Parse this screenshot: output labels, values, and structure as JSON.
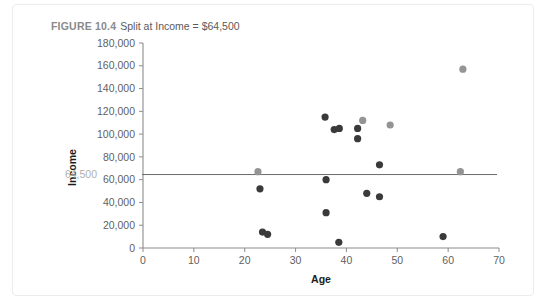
{
  "figure": {
    "number_label": "FIGURE 10.4",
    "caption": "Split at Income = $64,500"
  },
  "chart_data": {
    "type": "scatter",
    "title": "Split at Income = $64,500",
    "xlabel": "Age",
    "ylabel": "Income",
    "xlim": [
      0,
      70
    ],
    "ylim": [
      0,
      180000
    ],
    "xticks": [
      0,
      10,
      20,
      30,
      40,
      50,
      60,
      70
    ],
    "xtick_labels": [
      "0",
      "10",
      "20",
      "30",
      "40",
      "50",
      "60",
      "70"
    ],
    "yticks": [
      0,
      20000,
      40000,
      60000,
      80000,
      100000,
      120000,
      140000,
      160000,
      180000
    ],
    "ytick_labels": [
      "0",
      "20,000",
      "40,000",
      "60,000",
      "80,000",
      "100,000",
      "120,000",
      "140,000",
      "160,000",
      "180,000"
    ],
    "grid": false,
    "legend": null,
    "threshold": {
      "value": 64500,
      "label": "64,500",
      "orientation": "horizontal",
      "color": "#6b6b6b"
    },
    "colors": {
      "dark_point": "#3a3a3a",
      "light_point": "#949494",
      "axis": "#8c8c8c",
      "threshold": "#6b6b6b",
      "threshold_label": "#b0b0b0",
      "title": "#6f6f6f",
      "background": "#ffffff"
    },
    "series": [
      {
        "name": "dark-points",
        "color": "#3a3a3a",
        "points": [
          {
            "x": 23.5,
            "y": 14000
          },
          {
            "x": 24.5,
            "y": 12000
          },
          {
            "x": 23.0,
            "y": 52000
          },
          {
            "x": 35.8,
            "y": 115000
          },
          {
            "x": 37.6,
            "y": 104000
          },
          {
            "x": 38.6,
            "y": 105000
          },
          {
            "x": 36.0,
            "y": 60000
          },
          {
            "x": 36.0,
            "y": 31000
          },
          {
            "x": 38.5,
            "y": 5000
          },
          {
            "x": 42.2,
            "y": 105000
          },
          {
            "x": 42.2,
            "y": 96000
          },
          {
            "x": 44.0,
            "y": 48000
          },
          {
            "x": 46.5,
            "y": 45000
          },
          {
            "x": 46.5,
            "y": 73000
          },
          {
            "x": 59.0,
            "y": 10000
          }
        ]
      },
      {
        "name": "light-points",
        "color": "#949494",
        "points": [
          {
            "x": 22.6,
            "y": 67000
          },
          {
            "x": 43.2,
            "y": 112000
          },
          {
            "x": 48.6,
            "y": 108000
          },
          {
            "x": 62.9,
            "y": 157000
          },
          {
            "x": 62.4,
            "y": 67000
          }
        ]
      }
    ]
  }
}
